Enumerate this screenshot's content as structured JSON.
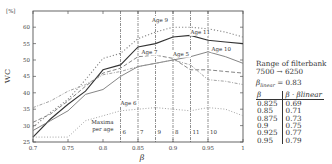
{
  "chart_data": {
    "type": "line",
    "title": "",
    "xlabel": "β",
    "ylabel": "WC",
    "yunit": "[%]",
    "xlim": [
      0.7,
      1.0
    ],
    "ylim": [
      25,
      65
    ],
    "xticks": [
      "0.7",
      "0.75",
      "0.8",
      "0.85",
      "0.9",
      "0.95",
      "1"
    ],
    "yticks": [
      "25",
      "30",
      "35",
      "40",
      "45",
      "50",
      "55",
      "60"
    ],
    "grid": false,
    "x": [
      0.7,
      0.725,
      0.75,
      0.775,
      0.8,
      0.825,
      0.85,
      0.875,
      0.9,
      0.925,
      0.95,
      0.975,
      1.0
    ],
    "series": [
      {
        "name": "Age 11",
        "style": "solid-dark",
        "values": [
          26.5,
          32,
          36.5,
          40.5,
          47,
          48.5,
          54,
          55,
          57,
          57.5,
          56,
          55.5,
          55
        ]
      },
      {
        "name": "Age 10",
        "style": "solid-light",
        "values": [
          28.5,
          31.5,
          34.5,
          39.5,
          41,
          45,
          48,
          49,
          50,
          51,
          52.5,
          51,
          49
        ]
      },
      {
        "name": "Age 9",
        "style": "dotted",
        "values": [
          29.5,
          34,
          38,
          44,
          50.5,
          52,
          56.5,
          58.5,
          60,
          60,
          59.5,
          58.5,
          57
        ]
      },
      {
        "name": "Age 7",
        "style": "dashed",
        "values": [
          31,
          33.5,
          37.5,
          42,
          46,
          47.5,
          51,
          51.5,
          50.5,
          47,
          47,
          46.5,
          46
        ]
      },
      {
        "name": "Age 5",
        "style": "dash-dot",
        "values": [
          35.5,
          37.5,
          40.5,
          42.5,
          45.5,
          46.5,
          48,
          49,
          50,
          48.5,
          44,
          43.5,
          42.5
        ]
      },
      {
        "name": "Age 6",
        "style": "dotted-light",
        "values": [
          26.5,
          26.5,
          26.5,
          31.5,
          33,
          34.5,
          35,
          35.5,
          35,
          34.5,
          35.5,
          35,
          33
        ]
      }
    ],
    "vertical_markers": {
      "caption": [
        "Maxima",
        "per age"
      ],
      "lines": [
        {
          "x": 0.825,
          "age": "6"
        },
        {
          "x": 0.85,
          "age": "7"
        },
        {
          "x": 0.875,
          "age": "9"
        },
        {
          "x": 0.9,
          "age": "8"
        },
        {
          "x": 0.925,
          "age": "11"
        },
        {
          "x": 0.95,
          "age": "10"
        }
      ]
    },
    "annotations": [
      {
        "text": "Age 9",
        "x": 0.87,
        "y": 61.5
      },
      {
        "text": "Age 11",
        "x": 0.925,
        "y": 57.8
      },
      {
        "text": "Age 7",
        "x": 0.855,
        "y": 51.8
      },
      {
        "text": "Age 5",
        "x": 0.9,
        "y": 51.2
      },
      {
        "text": "Age 10",
        "x": 0.955,
        "y": 52.8
      },
      {
        "text": "Age 6",
        "x": 0.825,
        "y": 36.2
      }
    ]
  },
  "side_panel": {
    "title_line1": "Range of filterbank",
    "title_line2": "7500 → 6250",
    "linear_eq": "βlinear = 0.83",
    "table": {
      "headers": [
        "β",
        "β · βlinear"
      ],
      "rows": [
        [
          "0.825",
          "0.69"
        ],
        [
          "0.85",
          "0.71"
        ],
        [
          "0.875",
          "0.73"
        ],
        [
          "0.9",
          "0.75"
        ],
        [
          "0.925",
          "0.77"
        ],
        [
          "0.95",
          "0.79"
        ]
      ]
    }
  }
}
